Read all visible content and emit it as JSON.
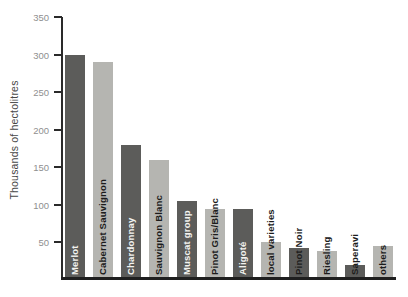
{
  "chart_data": {
    "type": "bar",
    "title": "",
    "xlabel": "",
    "ylabel": "Thousands of hectolitres",
    "ylim": [
      0,
      350
    ],
    "yticks": [
      50,
      100,
      150,
      200,
      250,
      300,
      350
    ],
    "grid": false,
    "legend": null,
    "categories": [
      "Merlot",
      "Cabernet Sauvignon",
      "Chardonnay",
      "Sauvignon Blanc",
      "Muscat group",
      "Pinot Gris/Blanc",
      "Aligoté",
      "local varieties",
      "Pinot Noir",
      "Riesling",
      "Saperavi",
      "others"
    ],
    "values": [
      300,
      290,
      180,
      160,
      105,
      95,
      95,
      50,
      42,
      38,
      20,
      45
    ],
    "bar_color_keys": [
      "dark",
      "light",
      "dark",
      "light",
      "dark",
      "light",
      "dark",
      "light",
      "dark",
      "light",
      "dark",
      "light"
    ],
    "colors": {
      "dark_bar": "#5c5c5a",
      "light_bar": "#b5b5b1",
      "axis": "#2a2a2a",
      "tick_label": "#8f8f8f",
      "label_on_dark": "#f3f3f0",
      "label_on_light": "#1c1c1c"
    },
    "label_text_color_keys": [
      "on_dark",
      "on_light",
      "on_dark",
      "on_light",
      "on_dark",
      "on_light",
      "on_dark",
      "on_light",
      "on_light",
      "on_light",
      "on_light",
      "on_light"
    ]
  }
}
